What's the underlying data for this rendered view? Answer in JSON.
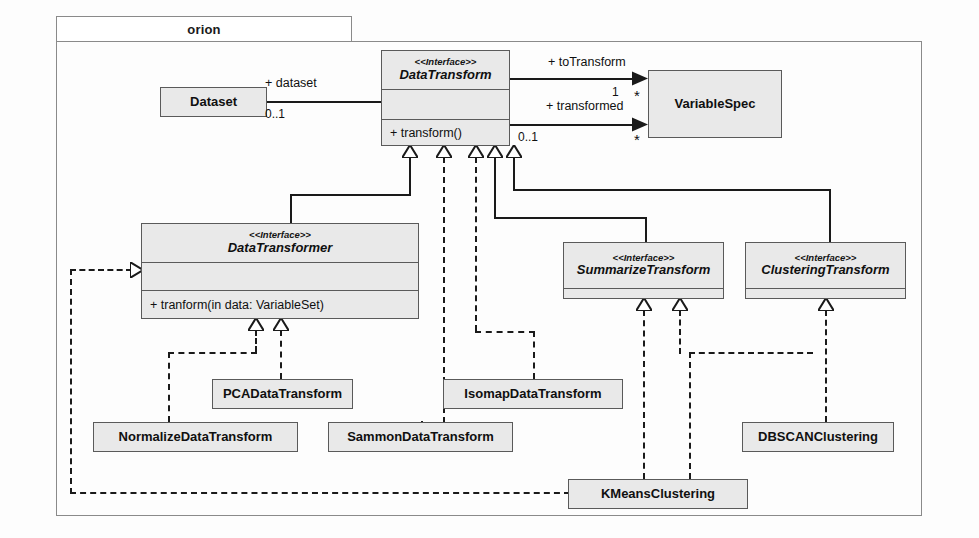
{
  "package": {
    "name": "orion"
  },
  "classes": {
    "dataset": {
      "name": "Dataset"
    },
    "data_transform": {
      "stereotype": "<<Interface>>",
      "name": "DataTransform",
      "operation": "+ transform()"
    },
    "variable_spec": {
      "name": "VariableSpec"
    },
    "data_transformer": {
      "stereotype": "<<Interface>>",
      "name": "DataTransformer",
      "operation": "+ tranform(in data: VariableSet)"
    },
    "summarize_transform": {
      "stereotype": "<<Interface>>",
      "name": "SummarizeTransform"
    },
    "clustering_transform": {
      "stereotype": "<<Interface>>",
      "name": "ClusteringTransform"
    },
    "pca": {
      "name": "PCADataTransform"
    },
    "normalize": {
      "name": "NormalizeDataTransform"
    },
    "sammon": {
      "name": "SammonDataTransform"
    },
    "isomap": {
      "name": "IsomapDataTransform"
    },
    "dbscan": {
      "name": "DBSCANClustering"
    },
    "kmeans": {
      "name": "KMeansClustering"
    }
  },
  "associations": {
    "dataset_role": "+ dataset",
    "dataset_mult": "0..1",
    "to_transform_role": "+ toTransform",
    "to_transform_source_mult": "1",
    "to_transform_target_mult": "*",
    "transformed_role": "+ transformed",
    "transformed_source_mult": "0..1",
    "transformed_target_mult": "*"
  },
  "colors": {
    "fill": "#e9e9e9",
    "stroke": "#5a5a5a",
    "line": "#1a1a1a",
    "package_border": "#8a8a8a"
  }
}
